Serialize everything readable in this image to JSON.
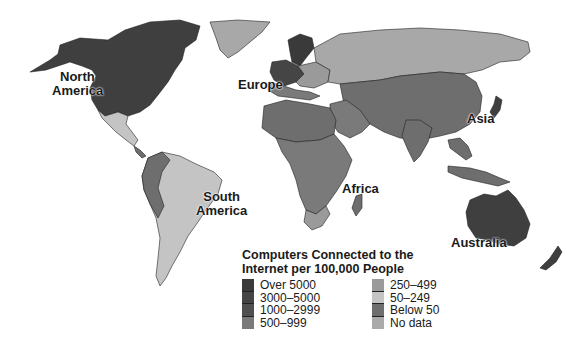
{
  "map": {
    "regions": [
      {
        "name": "North America",
        "x": 52,
        "y": 70
      },
      {
        "name": "Europe",
        "x": 238,
        "y": 78
      },
      {
        "name": "Asia",
        "x": 467,
        "y": 112
      },
      {
        "name": "South America",
        "x": 196,
        "y": 190
      },
      {
        "name": "Africa",
        "x": 342,
        "y": 182
      },
      {
        "name": "Australia",
        "x": 451,
        "y": 236
      }
    ],
    "labels": {
      "north_america_1": "North",
      "north_america_2": "America",
      "europe": "Europe",
      "asia": "Asia",
      "south_america_1": "South",
      "south_america_2": "America",
      "africa": "Africa",
      "australia": "Australia"
    }
  },
  "legend": {
    "title_line1": "Computers Connected to the",
    "title_line2": "Internet per 100,000 People",
    "items": [
      {
        "label": "Over 5000",
        "color": "#3a3a3a"
      },
      {
        "label": "3000–5000",
        "color": "#454545"
      },
      {
        "label": "1000–2999",
        "color": "#4f4f4f"
      },
      {
        "label": "500–999",
        "color": "#7a7a7a"
      },
      {
        "label": "250–499",
        "color": "#9a9a9a"
      },
      {
        "label": "50–249",
        "color": "#c4c4c4"
      },
      {
        "label": "Below 50",
        "color": "#6e6e6e"
      },
      {
        "label": "No data",
        "color": "#aaaaaa"
      }
    ]
  }
}
